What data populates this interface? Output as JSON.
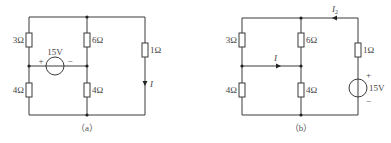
{
  "diagrams": [
    {
      "caption": "（a）",
      "resistors": {
        "r_top_left": "3Ω",
        "r_bottom_left": "4Ω",
        "r_top_mid": "6Ω",
        "r_bottom_mid": "4Ω",
        "r_right": "1Ω"
      },
      "source": {
        "value": "15V",
        "plus": "+",
        "minus": "−",
        "orientation": "horizontal"
      },
      "current": {
        "label": "I",
        "direction": "down"
      }
    },
    {
      "caption": "（b）",
      "resistors": {
        "r_top_left": "3Ω",
        "r_bottom_left": "4Ω",
        "r_top_mid": "6Ω",
        "r_bottom_mid": "4Ω",
        "r_right": "1Ω"
      },
      "source": {
        "value": "15V",
        "plus": "+",
        "minus": "−",
        "orientation": "vertical"
      },
      "current": {
        "label": "I",
        "direction": "right"
      },
      "current2": {
        "label": "I",
        "subscript": "2",
        "direction": "left"
      }
    }
  ]
}
